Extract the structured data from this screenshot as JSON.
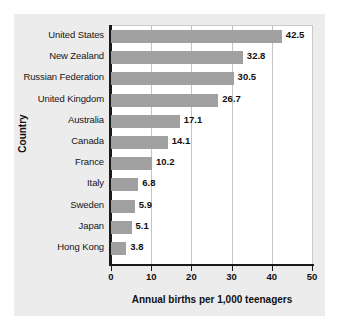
{
  "chart_data": {
    "type": "bar",
    "orientation": "horizontal",
    "title": "",
    "xlabel": "Annual births per 1,000 teenagers",
    "ylabel": "Country",
    "xlim": [
      0,
      50
    ],
    "xticks": [
      0,
      10,
      20,
      30,
      40,
      50
    ],
    "xtick_labels": [
      "0",
      "10",
      "20",
      "30",
      "40",
      "50"
    ],
    "grid": "vertical",
    "legend": "none",
    "categories": [
      "United States",
      "New Zealand",
      "Russian Federation",
      "United Kingdom",
      "Australia",
      "Canada",
      "France",
      "Italy",
      "Sweden",
      "Japan",
      "Hong Kong"
    ],
    "values": [
      42.5,
      32.8,
      30.5,
      26.7,
      17.1,
      14.1,
      10.2,
      6.8,
      5.9,
      5.1,
      3.8
    ],
    "value_labels": [
      "42.5",
      "32.8",
      "30.5",
      "26.7",
      "17.1",
      "14.1",
      "10.2",
      "6.8",
      "5.9",
      "5.1",
      "3.8"
    ],
    "colors": {
      "bar": "#a0a0a0",
      "panel_background": "#ececed",
      "plot_background": "#ffffff",
      "axis": "#1a1a1a",
      "gridline": "#c4c4c4",
      "text": "#111111"
    }
  }
}
